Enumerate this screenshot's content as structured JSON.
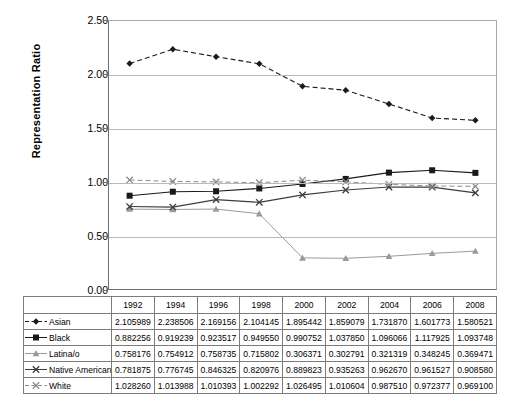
{
  "chart_data": {
    "type": "line",
    "title": "",
    "xlabel": "",
    "ylabel": "Representation Ratio",
    "ylim": [
      0.0,
      2.5
    ],
    "yticks": [
      "0.00",
      "0.50",
      "1.00",
      "1.50",
      "2.00",
      "2.50"
    ],
    "grid": true,
    "legend_position": "table-row-headers",
    "categories": [
      "1992",
      "1994",
      "1996",
      "1998",
      "2000",
      "2002",
      "2004",
      "2006",
      "2008"
    ],
    "series": [
      {
        "name": "Asian",
        "marker": "diamond",
        "line": "dashed",
        "color": "#1a1a1a",
        "values": [
          2.105989,
          2.238506,
          2.169156,
          2.104145,
          1.895442,
          1.859079,
          1.73187,
          1.601773,
          1.580521
        ],
        "labels": [
          "2.105989",
          "2.238506",
          "2.169156",
          "2.104145",
          "1.895442",
          "1.859079",
          "1.731870",
          "1.601773",
          "1.580521"
        ]
      },
      {
        "name": "Black",
        "marker": "square",
        "line": "solid",
        "color": "#1a1a1a",
        "values": [
          0.882256,
          0.919239,
          0.923517,
          0.94955,
          0.990752,
          1.03785,
          1.096066,
          1.117925,
          1.093748
        ],
        "labels": [
          "0.882256",
          "0.919239",
          "0.923517",
          "0.949550",
          "0.990752",
          "1.037850",
          "1.096066",
          "1.117925",
          "1.093748"
        ]
      },
      {
        "name": "Latina/o",
        "marker": "triangle",
        "line": "solid",
        "color": "#9a9a9a",
        "values": [
          0.758176,
          0.754912,
          0.758735,
          0.715802,
          0.306371,
          0.302791,
          0.321319,
          0.348245,
          0.369471
        ],
        "labels": [
          "0.758176",
          "0.754912",
          "0.758735",
          "0.715802",
          "0.306371",
          "0.302791",
          "0.321319",
          "0.348245",
          "0.369471"
        ]
      },
      {
        "name": "Native American",
        "marker": "x",
        "line": "solid",
        "color": "#3c3c3c",
        "values": [
          0.781875,
          0.776745,
          0.846325,
          0.820976,
          0.889823,
          0.935263,
          0.96267,
          0.961527,
          0.90858
        ],
        "labels": [
          "0.781875",
          "0.776745",
          "0.846325",
          "0.820976",
          "0.889823",
          "0.935263",
          "0.962670",
          "0.961527",
          "0.908580"
        ]
      },
      {
        "name": "White",
        "marker": "x",
        "line": "dashed",
        "color": "#8c8c8c",
        "values": [
          1.02826,
          1.013988,
          1.010393,
          1.002292,
          1.026495,
          1.010604,
          0.98751,
          0.972377,
          0.9691
        ],
        "labels": [
          "1.028260",
          "1.013988",
          "1.010393",
          "1.002292",
          "1.026495",
          "1.010604",
          "0.987510",
          "0.972377",
          "0.969100"
        ]
      }
    ]
  }
}
